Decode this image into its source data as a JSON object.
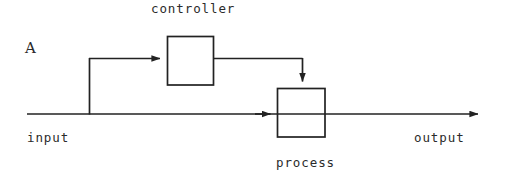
{
  "figure": {
    "panel_label": "A",
    "type": "control-system-block-diagram",
    "stroke_color": "#222222",
    "background_color": "#ffffff",
    "width": 512,
    "height": 182
  },
  "labels": {
    "controller": "controller",
    "process": "process",
    "input": "input",
    "output": "output"
  },
  "blocks": [
    {
      "name": "controller",
      "label": "controller",
      "label_position": "above",
      "x": 167,
      "y": 36,
      "width": 46,
      "height": 49
    },
    {
      "name": "process",
      "label": "process",
      "label_position": "below",
      "x": 277,
      "y": 88,
      "width": 48,
      "height": 49
    }
  ],
  "signals": [
    {
      "name": "input-to-output-line",
      "from": "input",
      "to": "output",
      "arrow": true,
      "y": 114,
      "x_start": 27,
      "x_end": 485
    },
    {
      "name": "branch-to-controller",
      "from": "input-line",
      "to": "controller",
      "arrow": true,
      "branch_x": 89,
      "branch_y_from": 114,
      "branch_y_to": 58,
      "x_end": 167
    },
    {
      "name": "controller-to-process",
      "from": "controller",
      "to": "process",
      "arrow": true,
      "y": 58,
      "x_start": 213,
      "drop_x": 302,
      "y_end": 88
    },
    {
      "name": "line-into-process",
      "from": "input-line",
      "to": "process",
      "arrow": true,
      "y": 114,
      "x_end": 277
    }
  ]
}
